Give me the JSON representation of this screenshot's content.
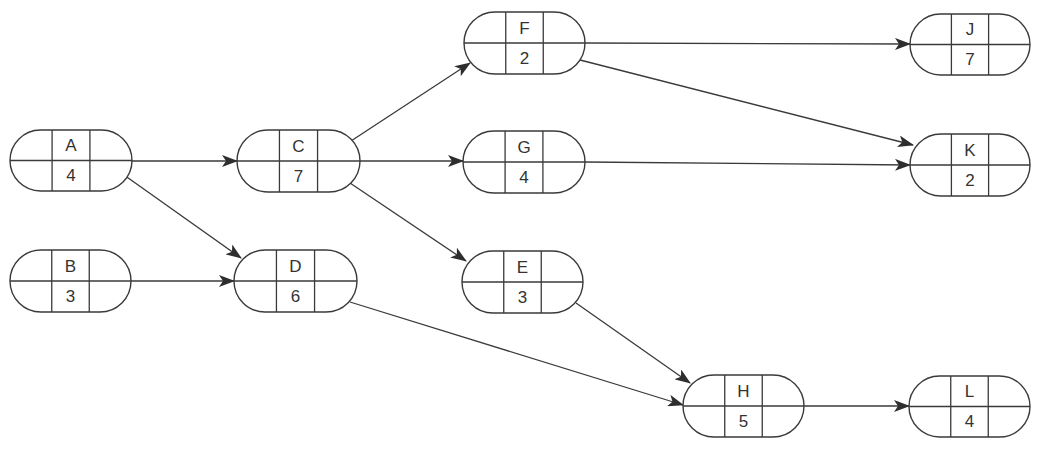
{
  "diagram": {
    "type": "activity-on-node network",
    "stroke_color": "#3a3a3a",
    "nodes": [
      {
        "id": "A",
        "duration": "4",
        "x": 10,
        "y": 130,
        "w": 122,
        "h": 61
      },
      {
        "id": "B",
        "duration": "3",
        "x": 10,
        "y": 250,
        "w": 121,
        "h": 62
      },
      {
        "id": "C",
        "duration": "7",
        "x": 237,
        "y": 130,
        "w": 123,
        "h": 62
      },
      {
        "id": "D",
        "duration": "6",
        "x": 234,
        "y": 250,
        "w": 123,
        "h": 62
      },
      {
        "id": "F",
        "duration": "2",
        "x": 464,
        "y": 12,
        "w": 121,
        "h": 62
      },
      {
        "id": "G",
        "duration": "4",
        "x": 463,
        "y": 131,
        "w": 122,
        "h": 62
      },
      {
        "id": "E",
        "duration": "3",
        "x": 462,
        "y": 251,
        "w": 121,
        "h": 62
      },
      {
        "id": "H",
        "duration": "5",
        "x": 683,
        "y": 375,
        "w": 121,
        "h": 62
      },
      {
        "id": "J",
        "duration": "7",
        "x": 910,
        "y": 14,
        "w": 120,
        "h": 61
      },
      {
        "id": "K",
        "duration": "2",
        "x": 910,
        "y": 134,
        "w": 120,
        "h": 62
      },
      {
        "id": "L",
        "duration": "4",
        "x": 909,
        "y": 376,
        "w": 121,
        "h": 61
      }
    ],
    "edges": [
      {
        "from": "A",
        "to": "C",
        "x1": 132,
        "y1": 161,
        "x2": 237,
        "y2": 161
      },
      {
        "from": "A",
        "to": "D",
        "x1": 124,
        "y1": 175,
        "x2": 241,
        "y2": 258
      },
      {
        "from": "B",
        "to": "D",
        "x1": 131,
        "y1": 281,
        "x2": 234,
        "y2": 281
      },
      {
        "from": "C",
        "to": "F",
        "x1": 351,
        "y1": 141,
        "x2": 470,
        "y2": 63
      },
      {
        "from": "C",
        "to": "G",
        "x1": 360,
        "y1": 161,
        "x2": 463,
        "y2": 161
      },
      {
        "from": "C",
        "to": "E",
        "x1": 350,
        "y1": 183,
        "x2": 466,
        "y2": 261
      },
      {
        "from": "D",
        "to": "H",
        "x1": 350,
        "y1": 302,
        "x2": 683,
        "y2": 405
      },
      {
        "from": "E",
        "to": "H",
        "x1": 576,
        "y1": 303,
        "x2": 690,
        "y2": 383
      },
      {
        "from": "F",
        "to": "J",
        "x1": 585,
        "y1": 43,
        "x2": 910,
        "y2": 44
      },
      {
        "from": "F",
        "to": "K",
        "x1": 580,
        "y1": 60,
        "x2": 913,
        "y2": 145
      },
      {
        "from": "G",
        "to": "K",
        "x1": 585,
        "y1": 162,
        "x2": 910,
        "y2": 165
      },
      {
        "from": "H",
        "to": "L",
        "x1": 804,
        "y1": 406,
        "x2": 909,
        "y2": 406
      }
    ]
  }
}
